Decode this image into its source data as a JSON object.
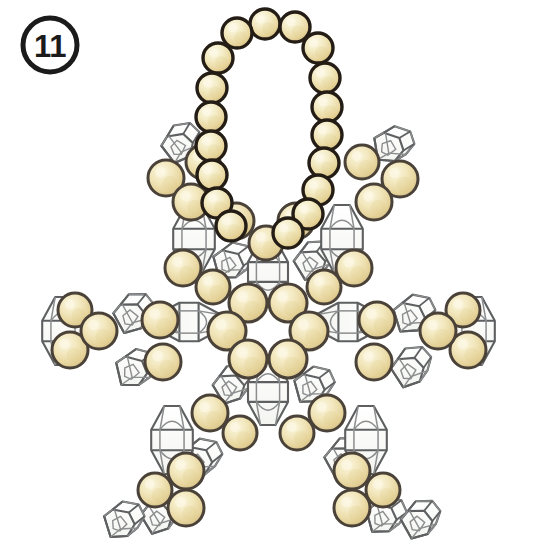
{
  "page": {
    "kind": "beading-pattern-diagram",
    "background_color": "#ffffff",
    "width": 534,
    "height": 555
  },
  "step_badge": {
    "label": "11",
    "shape": "circle",
    "cx": 50,
    "cy": 45,
    "r": 27,
    "stroke_color": "#1b1b1b",
    "fill_color": "#ffffff",
    "text_color": "#1b1b1b"
  },
  "palette": {
    "bead_gold_light": "#f6eecb",
    "bead_gold_mid": "#ecdda6",
    "bead_gold_deep": "#ddc882",
    "bead_outline_dark": "#241d16",
    "bead_outline_soft": "#4a4238",
    "crystal_stroke": "#5d5f60",
    "crystal_stroke_light": "#8b8d8e",
    "crystal_fill": "#fdfdfb",
    "background": "#ffffff"
  },
  "legend": {
    "round_bead": "round pearl / gold bead",
    "bicone_crystal": "bicone faceted crystal",
    "cube_crystal": "cube faceted crystal"
  },
  "hanging_loop": {
    "name": "hanging-loop",
    "bead_count": 18,
    "bead_radius": 15,
    "outline_width": 3.4,
    "beads": [
      {
        "cx": 265,
        "cy": 24
      },
      {
        "cx": 295,
        "cy": 27
      },
      {
        "cx": 237,
        "cy": 33
      },
      {
        "cx": 318,
        "cy": 48
      },
      {
        "cx": 218,
        "cy": 58
      },
      {
        "cx": 325,
        "cy": 78
      },
      {
        "cx": 212,
        "cy": 88
      },
      {
        "cx": 327,
        "cy": 107
      },
      {
        "cx": 211,
        "cy": 117
      },
      {
        "cx": 327,
        "cy": 135
      },
      {
        "cx": 211,
        "cy": 146
      },
      {
        "cx": 324,
        "cy": 163
      },
      {
        "cx": 212,
        "cy": 175
      },
      {
        "cx": 318,
        "cy": 190
      },
      {
        "cx": 217,
        "cy": 203
      },
      {
        "cx": 308,
        "cy": 214
      },
      {
        "cx": 231,
        "cy": 226
      },
      {
        "cx": 288,
        "cy": 233
      }
    ]
  },
  "center_ring": {
    "name": "center-ring",
    "bead_count": 6,
    "bead_radius": 19,
    "center": {
      "cx": 268,
      "cy": 330
    },
    "beads": [
      {
        "cx": 248,
        "cy": 303
      },
      {
        "cx": 288,
        "cy": 303
      },
      {
        "cx": 227,
        "cy": 331
      },
      {
        "cx": 309,
        "cy": 331
      },
      {
        "cx": 248,
        "cy": 359
      },
      {
        "cx": 288,
        "cy": 359
      }
    ]
  },
  "round_beads": {
    "name": "round-beads",
    "default_radius": 18,
    "items": [
      {
        "cx": 266,
        "cy": 243,
        "r": 17
      },
      {
        "cx": 296,
        "cy": 221,
        "r": 18
      },
      {
        "cx": 236,
        "cy": 221,
        "r": 18
      },
      {
        "cx": 203,
        "cy": 162,
        "r": 17
      },
      {
        "cx": 166,
        "cy": 178,
        "r": 18
      },
      {
        "cx": 191,
        "cy": 202,
        "r": 18
      },
      {
        "cx": 183,
        "cy": 268,
        "r": 18
      },
      {
        "cx": 213,
        "cy": 287,
        "r": 17
      },
      {
        "cx": 362,
        "cy": 162,
        "r": 17
      },
      {
        "cx": 400,
        "cy": 179,
        "r": 18
      },
      {
        "cx": 374,
        "cy": 202,
        "r": 18
      },
      {
        "cx": 354,
        "cy": 268,
        "r": 18
      },
      {
        "cx": 324,
        "cy": 287,
        "r": 17
      },
      {
        "cx": 75,
        "cy": 310,
        "r": 17
      },
      {
        "cx": 70,
        "cy": 350,
        "r": 18
      },
      {
        "cx": 99,
        "cy": 331,
        "r": 18
      },
      {
        "cx": 160,
        "cy": 320,
        "r": 18
      },
      {
        "cx": 163,
        "cy": 362,
        "r": 18
      },
      {
        "cx": 463,
        "cy": 310,
        "r": 17
      },
      {
        "cx": 468,
        "cy": 350,
        "r": 18
      },
      {
        "cx": 438,
        "cy": 331,
        "r": 18
      },
      {
        "cx": 377,
        "cy": 320,
        "r": 18
      },
      {
        "cx": 374,
        "cy": 362,
        "r": 18
      },
      {
        "cx": 155,
        "cy": 490,
        "r": 17
      },
      {
        "cx": 186,
        "cy": 508,
        "r": 18
      },
      {
        "cx": 186,
        "cy": 471,
        "r": 18
      },
      {
        "cx": 210,
        "cy": 413,
        "r": 18
      },
      {
        "cx": 240,
        "cy": 433,
        "r": 17
      },
      {
        "cx": 383,
        "cy": 490,
        "r": 17
      },
      {
        "cx": 352,
        "cy": 508,
        "r": 18
      },
      {
        "cx": 352,
        "cy": 471,
        "r": 18
      },
      {
        "cx": 327,
        "cy": 413,
        "r": 18
      },
      {
        "cx": 297,
        "cy": 433,
        "r": 17
      }
    ]
  },
  "bicone_crystals": {
    "name": "bicone-crystals",
    "items": [
      {
        "cx": 268,
        "cy": 272,
        "rx": 25,
        "ry": 33,
        "rot": 0
      },
      {
        "cx": 268,
        "cy": 392,
        "rx": 25,
        "ry": 33,
        "rot": 0
      },
      {
        "cx": 189,
        "cy": 322,
        "rx": 24,
        "ry": 32,
        "rot": 90
      },
      {
        "cx": 348,
        "cy": 322,
        "rx": 24,
        "ry": 32,
        "rot": 90
      },
      {
        "cx": 194,
        "cy": 239,
        "rx": 26,
        "ry": 34,
        "rot": 0
      },
      {
        "cx": 342,
        "cy": 239,
        "rx": 26,
        "ry": 34,
        "rot": 0
      },
      {
        "cx": 63,
        "cy": 331,
        "rx": 26,
        "ry": 34,
        "rot": 0
      },
      {
        "cx": 474,
        "cy": 331,
        "rx": 26,
        "ry": 34,
        "rot": 0
      },
      {
        "cx": 172,
        "cy": 440,
        "rx": 26,
        "ry": 34,
        "rot": 0
      },
      {
        "cx": 366,
        "cy": 440,
        "rx": 26,
        "ry": 34,
        "rot": 0
      }
    ]
  },
  "cube_crystals": {
    "name": "cube-crystals",
    "items": [
      {
        "cx": 178,
        "cy": 148,
        "s": 30,
        "rot": -14
      },
      {
        "cx": 228,
        "cy": 265,
        "s": 30,
        "rot": 8
      },
      {
        "cx": 186,
        "cy": 320,
        "s": 0,
        "rot": 0
      },
      {
        "cx": 130,
        "cy": 318,
        "s": 31,
        "rot": -6
      },
      {
        "cx": 131,
        "cy": 372,
        "s": 31,
        "rot": 10
      },
      {
        "cx": 203,
        "cy": 213,
        "s": 0,
        "rot": 0
      },
      {
        "cx": 229,
        "cy": 389,
        "s": 30,
        "rot": -8
      },
      {
        "cx": 196,
        "cy": 462,
        "s": 31,
        "rot": 6
      },
      {
        "cx": 157,
        "cy": 519,
        "s": 30,
        "rot": -8
      },
      {
        "cx": 388,
        "cy": 148,
        "s": 30,
        "rot": 14
      },
      {
        "cx": 310,
        "cy": 265,
        "s": 30,
        "rot": -8
      },
      {
        "cx": 409,
        "cy": 318,
        "s": 31,
        "rot": 6
      },
      {
        "cx": 408,
        "cy": 372,
        "s": 31,
        "rot": -10
      },
      {
        "cx": 309,
        "cy": 389,
        "s": 30,
        "rot": 8
      },
      {
        "cx": 341,
        "cy": 462,
        "s": 31,
        "rot": -6
      },
      {
        "cx": 381,
        "cy": 519,
        "s": 30,
        "rot": 8
      },
      {
        "cx": 417,
        "cy": 524,
        "s": 30,
        "rot": -6
      },
      {
        "cx": 119,
        "cy": 524,
        "s": 30,
        "rot": 6
      }
    ]
  }
}
